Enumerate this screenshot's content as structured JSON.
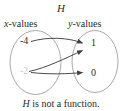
{
  "figure": {
    "map_title": "H",
    "caption_italic": "H",
    "caption_rest": " is not a function.",
    "domain_label_italic": "x",
    "domain_label_rest": "-values",
    "range_label_italic": "y",
    "range_label_rest": "-values",
    "colors": {
      "ink": "#2b2b2b",
      "ellipse_stroke": "#9a9a9a",
      "arrow_stroke": "#4a4a4a",
      "faded_element": "#c9c9c9",
      "background": "#ffffff"
    }
  },
  "diagram_data": {
    "type": "mapping-diagram",
    "relation_name": "H",
    "is_function": false,
    "domain": {
      "label": "x-values",
      "elements": [
        {
          "value": "-4",
          "faded": false
        },
        {
          "value": "-2",
          "faded": true
        }
      ]
    },
    "range": {
      "label": "y-values",
      "elements": [
        {
          "value": "1",
          "faded": false
        },
        {
          "value": "0",
          "faded": false
        }
      ]
    },
    "arrows": [
      {
        "from": "-4",
        "to": "1"
      },
      {
        "from": "-2",
        "to": "1"
      },
      {
        "from": "-2",
        "to": "0"
      }
    ],
    "caption": "H is not a function."
  }
}
